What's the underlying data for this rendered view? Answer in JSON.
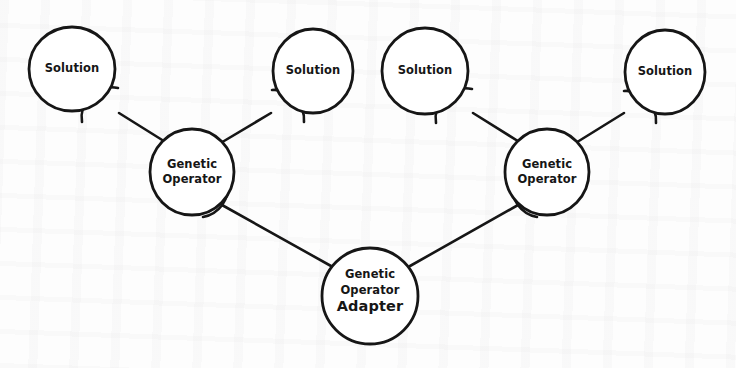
{
  "diagram": {
    "notation": "uml-ball-and-socket",
    "background_color": "#fdfdfd",
    "stroke_color": "#161616",
    "text_color": "#161616",
    "canvas": {
      "width": 736,
      "height": 368
    },
    "nodes": [
      {
        "id": "solution-1",
        "label": "Solution",
        "role": "leaf",
        "cx": 72,
        "cy": 69,
        "rx": 43,
        "ry": 42
      },
      {
        "id": "solution-2",
        "label": "Solution",
        "role": "leaf",
        "cx": 313,
        "cy": 71,
        "rx": 40,
        "ry": 42
      },
      {
        "id": "solution-3",
        "label": "Solution",
        "role": "leaf",
        "cx": 425,
        "cy": 71,
        "rx": 43,
        "ry": 43
      },
      {
        "id": "solution-4",
        "label": "Solution",
        "role": "leaf",
        "cx": 665,
        "cy": 72,
        "rx": 40,
        "ry": 42
      },
      {
        "id": "genetic-operator-left",
        "label_line1": "Genetic",
        "label_line2": "Operator",
        "role": "branch",
        "cx": 192,
        "cy": 172,
        "rx": 42,
        "ry": 43
      },
      {
        "id": "genetic-operator-right",
        "label_line1": "Genetic",
        "label_line2": "Operator",
        "role": "branch",
        "cx": 547,
        "cy": 172,
        "rx": 42,
        "ry": 43
      },
      {
        "id": "genetic-operator-adapter",
        "label_line1": "Genetic",
        "label_line2": "Operator",
        "label_line3": "Adapter",
        "role": "root",
        "cx": 370,
        "cy": 296,
        "rx": 48,
        "ry": 48
      }
    ],
    "connections": [
      {
        "id": "conn-1",
        "from": "genetic-operator-left",
        "to": "solution-1",
        "socket_at": "solution-1"
      },
      {
        "id": "conn-2",
        "from": "genetic-operator-left",
        "to": "solution-2",
        "socket_at": "solution-2"
      },
      {
        "id": "conn-3",
        "from": "genetic-operator-right",
        "to": "solution-3",
        "socket_at": "solution-3"
      },
      {
        "id": "conn-4",
        "from": "genetic-operator-right",
        "to": "solution-4",
        "socket_at": "solution-4"
      },
      {
        "id": "conn-5",
        "from": "genetic-operator-adapter",
        "to": "genetic-operator-left",
        "socket_at": "genetic-operator-left"
      },
      {
        "id": "conn-6",
        "from": "genetic-operator-adapter",
        "to": "genetic-operator-right",
        "socket_at": "genetic-operator-right"
      }
    ]
  }
}
